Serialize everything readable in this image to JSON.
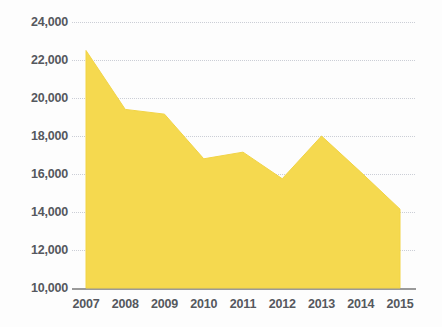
{
  "chart_data": {
    "type": "area",
    "title": "",
    "subtitle": "",
    "xlabel": "",
    "ylabel": "",
    "categories": [
      "2007",
      "2008",
      "2009",
      "2010",
      "2011",
      "2012",
      "2013",
      "2014",
      "2015"
    ],
    "x": [
      2007,
      2008,
      2009,
      2010,
      2011,
      2012,
      2013,
      2014,
      2015
    ],
    "values": [
      22500,
      19400,
      19150,
      16800,
      17150,
      15750,
      18000,
      16100,
      14150
    ],
    "series": [
      {
        "name": "",
        "values": [
          22500,
          19400,
          19150,
          16800,
          17150,
          15750,
          18000,
          16100,
          14150
        ]
      }
    ],
    "ylim": [
      10000,
      24000
    ],
    "ytick_step": 2000,
    "ytick_labels": [
      "10,000",
      "12,000",
      "14,000",
      "16,000",
      "18,000",
      "20,000",
      "22,000",
      "24,000"
    ],
    "ytick_values": [
      10000,
      12000,
      14000,
      16000,
      18000,
      20000,
      22000,
      24000
    ],
    "xtick_labels": [
      "2007",
      "2008",
      "2009",
      "2010",
      "2011",
      "2012",
      "2013",
      "2014",
      "2015"
    ],
    "grid": true,
    "grid_style": "dotted-horizontal",
    "legend": false,
    "legend_position": "none",
    "annotations": []
  },
  "style": {
    "area_fill": "#f5d94f",
    "area_stroke": "#f2d445",
    "background": "#fdfdfd",
    "gridline_color": "#c9ccd4",
    "axis_line_color": "#9a9a9a",
    "tick_label_color": "#55585e"
  }
}
